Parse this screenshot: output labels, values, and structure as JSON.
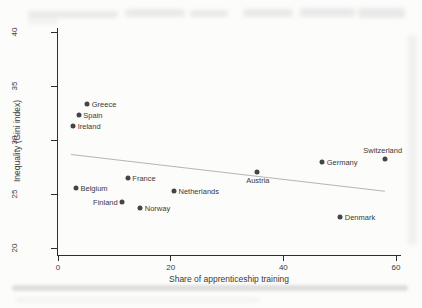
{
  "chart_data": {
    "type": "scatter",
    "title": "",
    "xlabel": "Share of apprenticeship training",
    "ylabel": "Inequality (Gini index)",
    "xticks": [
      0,
      20,
      40,
      60
    ],
    "yticks": [
      20,
      25,
      30,
      35,
      40
    ],
    "xlim": [
      0,
      60
    ],
    "ylim": [
      20,
      40
    ],
    "grid": false,
    "legend": false,
    "points": [
      {
        "label": "Greece",
        "x": 5.2,
        "y": 33.3,
        "label_pos": "right"
      },
      {
        "label": "Spain",
        "x": 3.7,
        "y": 32.3,
        "label_pos": "right"
      },
      {
        "label": "Ireland",
        "x": 2.7,
        "y": 31.3,
        "label_pos": "right"
      },
      {
        "label": "Belgium",
        "x": 3.2,
        "y": 25.6,
        "label_pos": "right"
      },
      {
        "label": "France",
        "x": 12.4,
        "y": 26.5,
        "label_pos": "right"
      },
      {
        "label": "Finland",
        "x": 11.4,
        "y": 24.3,
        "label_pos": "left"
      },
      {
        "label": "Norway",
        "x": 14.6,
        "y": 23.7,
        "label_pos": "right"
      },
      {
        "label": "Netherlands",
        "x": 20.6,
        "y": 25.3,
        "label_pos": "right"
      },
      {
        "label": "Austria",
        "x": 35.3,
        "y": 27.0,
        "label_pos": "below"
      },
      {
        "label": "Germany",
        "x": 46.9,
        "y": 28.0,
        "label_pos": "right"
      },
      {
        "label": "Switzerland",
        "x": 58.0,
        "y": 28.2,
        "label_pos": "above"
      },
      {
        "label": "Denmark",
        "x": 50.1,
        "y": 22.9,
        "label_pos": "right"
      }
    ],
    "trendline": {
      "x1": 2.3,
      "y1": 28.7,
      "x2": 58.0,
      "y2": 25.3
    },
    "colors": {
      "dot": "#454545",
      "trend_line": "#b5b5b5",
      "axis": "#2e2e2e",
      "text": "#3a3a3a",
      "background": "#fcfcfb"
    }
  }
}
